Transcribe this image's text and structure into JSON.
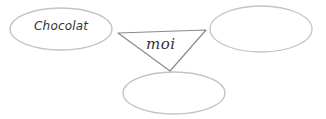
{
  "diagram": {
    "center": {
      "label": "moi",
      "shape": "inverted-triangle"
    },
    "bubbles": [
      {
        "position": "left",
        "label": "Chocolat"
      },
      {
        "position": "right",
        "label": ""
      },
      {
        "position": "bottom",
        "label": ""
      }
    ],
    "colors": {
      "stroke": "#bdbdbd",
      "triangle_stroke": "#8a8a8a",
      "text": "#333333",
      "background": "#ffffff"
    }
  }
}
